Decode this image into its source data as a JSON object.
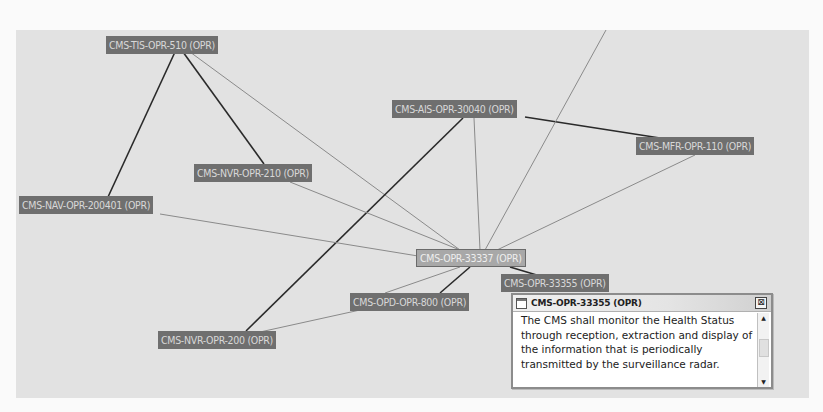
{
  "diagram": {
    "background_color": "#e2e2e2",
    "node_color": "#6f6f6f",
    "selected_node_color": "#a8a8a8",
    "nodes": [
      {
        "id": "n1",
        "label": "CMS-TIS-OPR-510 (OPR)",
        "x": 106,
        "y": 36
      },
      {
        "id": "n2",
        "label": "CMS-AIS-OPR-30040 (OPR)",
        "x": 392,
        "y": 100
      },
      {
        "id": "n3",
        "label": "CMS-MFR-OPR-110 (OPR)",
        "x": 636,
        "y": 137
      },
      {
        "id": "n4",
        "label": "CMS-NVR-OPR-210 (OPR)",
        "x": 194,
        "y": 164
      },
      {
        "id": "n5",
        "label": "CMS-NAV-OPR-200401 (OPR)",
        "x": 19,
        "y": 196
      },
      {
        "id": "n6",
        "label": "CMS-OPR-33337 (OPR)",
        "x": 416,
        "y": 249,
        "selected": true
      },
      {
        "id": "n7",
        "label": "CMS-OPR-33355 (OPR)",
        "x": 501,
        "y": 274
      },
      {
        "id": "n8",
        "label": "CMS-OPD-OPR-800 (OPR)",
        "x": 350,
        "y": 293
      },
      {
        "id": "n9",
        "label": "CMS-NVR-OPR-200 (OPR)",
        "x": 158,
        "y": 331
      }
    ],
    "edges": [
      {
        "from": "n1",
        "to": "n5",
        "weight": "strong",
        "x1": 175,
        "y1": 52,
        "x2": 108,
        "y2": 197
      },
      {
        "from": "n1",
        "to": "n4",
        "weight": "strong",
        "x1": 183,
        "y1": 52,
        "x2": 264,
        "y2": 164
      },
      {
        "from": "n1",
        "to": "n6",
        "weight": "weak",
        "x1": 190,
        "y1": 52,
        "x2": 460,
        "y2": 250
      },
      {
        "from": "n2",
        "to": "n3",
        "weight": "strong",
        "x1": 525,
        "y1": 117,
        "x2": 660,
        "y2": 138
      },
      {
        "from": "n2",
        "to": "n9",
        "weight": "strong",
        "x1": 463,
        "y1": 118,
        "x2": 246,
        "y2": 331
      },
      {
        "from": "n2",
        "to": "n6",
        "weight": "weak",
        "x1": 474,
        "y1": 118,
        "x2": 480,
        "y2": 250
      },
      {
        "from": "n3",
        "to": "n6",
        "weight": "weak",
        "x1": 695,
        "y1": 155,
        "x2": 497,
        "y2": 250
      },
      {
        "from": "n4",
        "to": "n6",
        "weight": "weak",
        "x1": 290,
        "y1": 182,
        "x2": 460,
        "y2": 250
      },
      {
        "from": "n5",
        "to": "n6",
        "weight": "weak",
        "x1": 160,
        "y1": 214,
        "x2": 418,
        "y2": 256
      },
      {
        "from": "external",
        "to": "n6",
        "weight": "weak",
        "x1": 606,
        "y1": 30,
        "x2": 485,
        "y2": 250
      },
      {
        "from": "n6",
        "to": "n7",
        "weight": "strong",
        "x1": 510,
        "y1": 267,
        "x2": 540,
        "y2": 276
      },
      {
        "from": "n6",
        "to": "n8",
        "weight": "strong",
        "x1": 470,
        "y1": 267,
        "x2": 440,
        "y2": 293
      },
      {
        "from": "n6",
        "to": "n8b",
        "weight": "weak",
        "x1": 460,
        "y1": 267,
        "x2": 385,
        "y2": 293
      },
      {
        "from": "n8",
        "to": "n9",
        "weight": "weak",
        "x1": 360,
        "y1": 310,
        "x2": 260,
        "y2": 332
      }
    ]
  },
  "popup": {
    "title": "CMS-OPR-33355 (OPR)",
    "close_label": "⊠",
    "body": "The CMS shall monitor the Health Status through reception, extraction and display of the information that is periodically transmitted by the surveillance radar.",
    "scroll_up": "▲",
    "scroll_down": "▼"
  }
}
